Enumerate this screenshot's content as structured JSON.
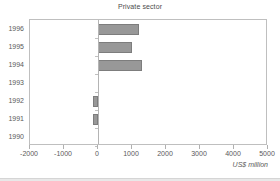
{
  "chart_data": {
    "type": "bar",
    "orientation": "horizontal",
    "title": "Private sector",
    "xlabel": "US$ million",
    "ylabel": "",
    "categories": [
      "1990",
      "1991",
      "1992",
      "1993",
      "1994",
      "1995",
      "1996"
    ],
    "values": [
      0,
      -150,
      -150,
      0,
      1300,
      1000,
      1200
    ],
    "xlim": [
      -2000,
      5000
    ],
    "xticks": [
      -2000,
      -1000,
      0,
      1000,
      2000,
      3000,
      4000,
      5000
    ],
    "xtick_labels": [
      "-2000",
      "-1000",
      "0",
      "1000",
      "2000",
      "3000",
      "4000",
      "5000"
    ],
    "grid": false,
    "legend": null,
    "bar_color": "#989898",
    "bar_edge_color": "#7d7d7d",
    "axis_color": "#bfbfbf",
    "text_color": "#5a5a5a",
    "display_order_top_to_bottom": [
      "1996",
      "1995",
      "1994",
      "1993",
      "1992",
      "1991",
      "1990"
    ]
  }
}
